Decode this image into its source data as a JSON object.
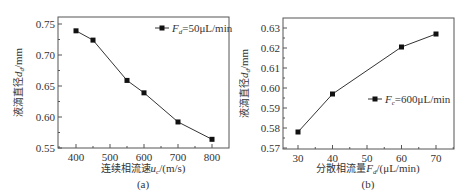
{
  "chart_data": [
    {
      "type": "line",
      "panel_label": "(a)",
      "title": "",
      "xlabel": "连续相流速u_c/(m/s)",
      "xlabel_main": "连续相流速",
      "xlabel_var": "u",
      "xlabel_sub": "c",
      "xlabel_unit": "/(m/s)",
      "ylabel": "液滴直径d_d/mm",
      "ylabel_main": "液滴直径",
      "ylabel_var": "d",
      "ylabel_sub": "d",
      "ylabel_unit": "/mm",
      "x": [
        400,
        450,
        550,
        600,
        700,
        800
      ],
      "series": [
        {
          "name": "F_d=50μL/min",
          "values": [
            0.739,
            0.724,
            0.659,
            0.639,
            0.592,
            0.564
          ]
        }
      ],
      "legend": {
        "var": "F",
        "sub": "d",
        "text": "=50μL/min",
        "position": "upper right"
      },
      "xticks": [
        "400",
        "500",
        "600",
        "700",
        "800"
      ],
      "yticks": [
        "0.55",
        "0.60",
        "0.65",
        "0.70",
        "0.75"
      ],
      "xlim": [
        350,
        850
      ],
      "ylim": [
        0.55,
        0.75
      ],
      "grid": false,
      "marker": "square"
    },
    {
      "type": "line",
      "panel_label": "(b)",
      "title": "",
      "xlabel": "分散相流量F_d/(μL/min)",
      "xlabel_main": "分散相流量",
      "xlabel_var": "F",
      "xlabel_sub": "d",
      "xlabel_unit": "/(μL/min)",
      "ylabel": "液滴直径d_d/mm",
      "ylabel_main": "液滴直径",
      "ylabel_var": "d",
      "ylabel_sub": "d",
      "ylabel_unit": "/mm",
      "x": [
        30,
        40,
        60,
        70
      ],
      "series": [
        {
          "name": "F_c=600μL/min",
          "values": [
            0.578,
            0.597,
            0.6205,
            0.627
          ]
        }
      ],
      "legend": {
        "var": "F",
        "sub": "c",
        "text": "=600μL/min",
        "position": "center right"
      },
      "xticks": [
        "30",
        "40",
        "50",
        "60",
        "70"
      ],
      "yticks": [
        "0.57",
        "0.58",
        "0.59",
        "0.60",
        "0.61",
        "0.62",
        "0.63"
      ],
      "xlim": [
        25,
        75
      ],
      "ylim": [
        0.57,
        0.633
      ],
      "grid": false,
      "marker": "square"
    }
  ]
}
